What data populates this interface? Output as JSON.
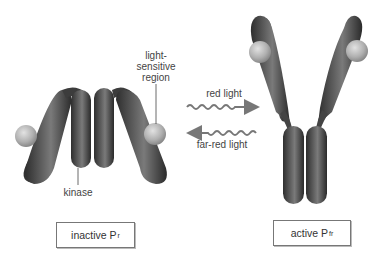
{
  "diagram": {
    "type": "phytochrome-conformation",
    "colors": {
      "protein_dark": "#3a3a3a",
      "protein_mid": "#666666",
      "protein_light": "#9a9a9a",
      "chromophore": "#b8b8b8",
      "arrow": "#777777",
      "box_border": "#777777"
    }
  },
  "labels": {
    "light_sensitive_line1": "light-",
    "light_sensitive_line2": "sensitive",
    "light_sensitive_line3": "region",
    "kinase": "kinase",
    "red_light": "red light",
    "far_red_light": "far-red light"
  },
  "states": {
    "inactive": {
      "label": "inactive P",
      "subscript": "r"
    },
    "active": {
      "label": "active P",
      "subscript": "fr"
    }
  },
  "arrows": [
    {
      "name": "red-light-arrow",
      "direction": "right",
      "label": "red light"
    },
    {
      "name": "far-red-light-arrow",
      "direction": "left",
      "label": "far-red light"
    }
  ]
}
